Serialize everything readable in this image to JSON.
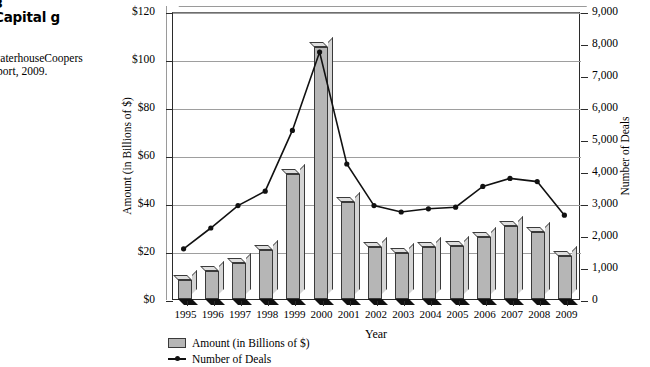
{
  "caption": {
    "figure_number": "3",
    "title": "Capital g",
    "source_line1": "waterhouseCoopers",
    "source_line2": "eport, 2009."
  },
  "chart_data": {
    "type": "bar",
    "title": "",
    "xlabel": "Year",
    "ylabel": "Amount (in Billions of $)",
    "y2label": "Number of Deals",
    "grid": true,
    "legend_position": "bottom-left",
    "categories": [
      "1995",
      "1996",
      "1997",
      "1998",
      "1999",
      "2000",
      "2001",
      "2002",
      "2003",
      "2004",
      "2005",
      "2006",
      "2007",
      "2008",
      "2009"
    ],
    "ylim": [
      0,
      120
    ],
    "y2lim": [
      0,
      9000
    ],
    "yticks": [
      "$0",
      "$20",
      "$40",
      "$60",
      "$80",
      "$100",
      "$120"
    ],
    "ytick_values": [
      0,
      20,
      40,
      60,
      80,
      100,
      120
    ],
    "y2ticks": [
      "0",
      "1,000",
      "2,000",
      "3,000",
      "4,000",
      "5,000",
      "6,000",
      "7,000",
      "8,000",
      "9,000"
    ],
    "y2tick_values": [
      0,
      1000,
      2000,
      3000,
      4000,
      5000,
      6000,
      7000,
      8000,
      9000
    ],
    "series": [
      {
        "name": "Amount (in Billions of $)",
        "kind": "bar",
        "axis": "left",
        "color": "#b6b6b6",
        "values": [
          8,
          11.5,
          15,
          20.5,
          52,
          105,
          40.5,
          21.5,
          19,
          21.5,
          22,
          26,
          30.5,
          28,
          18
        ]
      },
      {
        "name": "Number of Deals",
        "kind": "line",
        "axis": "right",
        "color": "#111111",
        "values": [
          1600,
          2250,
          2950,
          3400,
          5300,
          7750,
          4250,
          2950,
          2750,
          2850,
          2900,
          3550,
          3800,
          3700,
          2650
        ]
      }
    ]
  },
  "legend": {
    "items": [
      {
        "label": "Amount (in Billions of $)",
        "marker": "bar-swatch"
      },
      {
        "label": "Number of Deals",
        "marker": "line-marker"
      }
    ]
  }
}
